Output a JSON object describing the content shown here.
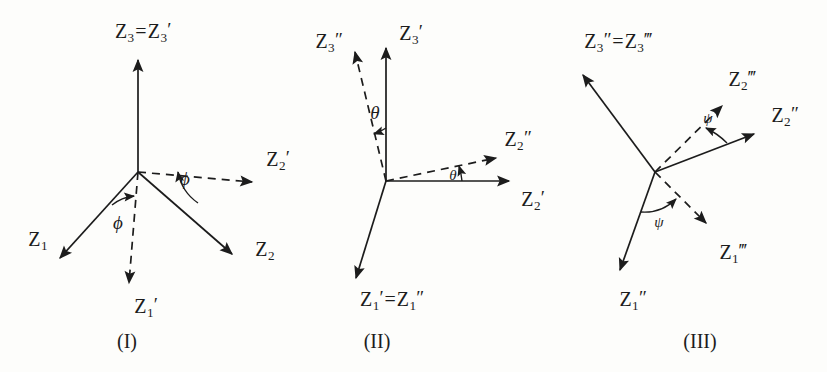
{
  "figure": {
    "width": 827,
    "height": 372,
    "background": "#fdfdfb",
    "ink": "#1c1c1c"
  },
  "panels": [
    {
      "id": "panel-1",
      "caption": "(I)",
      "caption_pos": [
        127,
        341
      ],
      "origin": [
        138,
        172
      ],
      "rotation_symbol": "ϕ",
      "axes": [
        {
          "name": "z3-equals-z3prime",
          "label": "Z₃=Z₃′",
          "label_html": "Z<sub>3</sub><span class=\"eq\">=</span>Z<sub>3</sub><span class=\"pr\">′</span>",
          "label_pos": [
            143,
            32
          ],
          "style": "solid",
          "tip": [
            138,
            55
          ]
        },
        {
          "name": "z1",
          "label": "Z₁",
          "label_html": "Z<sub>1</sub>",
          "label_pos": [
            38,
            240
          ],
          "style": "solid",
          "tip": [
            55,
            263
          ]
        },
        {
          "name": "z2",
          "label": "Z₂",
          "label_html": "Z<sub>2</sub>",
          "label_pos": [
            265,
            250
          ],
          "style": "solid",
          "tip": [
            237,
            258
          ]
        },
        {
          "name": "z1-prime",
          "label": "Z₁′",
          "label_html": "Z<sub>1</sub><span class=\"pr\">′</span>",
          "label_pos": [
            146,
            307
          ],
          "style": "dashed",
          "tip": [
            128,
            289
          ]
        },
        {
          "name": "z2-prime",
          "label": "Z₂′",
          "label_html": "Z<sub>2</sub><span class=\"pr\">′</span>",
          "label_pos": [
            278,
            160
          ],
          "style": "dashed",
          "tip": [
            258,
            183
          ]
        }
      ],
      "angle_marks": [
        {
          "name": "phi-left",
          "symbol": "ϕ",
          "pos": [
            118,
            222
          ]
        },
        {
          "name": "phi-right",
          "symbol": "ϕ",
          "pos": [
            185,
            178
          ]
        }
      ]
    },
    {
      "id": "panel-2",
      "caption": "(II)",
      "caption_pos": [
        377,
        341
      ],
      "origin": [
        386,
        181
      ],
      "rotation_symbol": "θ",
      "axes": [
        {
          "name": "z3-prime",
          "label": "Z₃′",
          "label_html": "Z<sub>3</sub><span class=\"pr\">′</span>",
          "label_pos": [
            411,
            34
          ],
          "style": "solid",
          "tip": [
            386,
            43
          ]
        },
        {
          "name": "z2-prime",
          "label": "Z₂′",
          "label_html": "Z<sub>2</sub><span class=\"pr\">′</span>",
          "label_pos": [
            533,
            200
          ],
          "style": "solid",
          "tip": [
            515,
            182
          ]
        },
        {
          "name": "z1-prime-equals-z1-dprime",
          "label": "Z₁′=Z₁″",
          "label_html": "Z<sub>1</sub><span class=\"pr\">′</span><span class=\"eq\">=</span>Z<sub>1</sub><span class=\"pr\">″</span>",
          "label_pos": [
            392,
            300
          ],
          "style": "solid",
          "tip": [
            351,
            283
          ]
        },
        {
          "name": "z3-dprime",
          "label": "Z₃″",
          "label_html": "Z<sub>3</sub><span class=\"pr\">″</span>",
          "label_pos": [
            329,
            42
          ],
          "style": "dashed",
          "tip": [
            352,
            47
          ]
        },
        {
          "name": "z2-dprime",
          "label": "Z₂″",
          "label_html": "Z<sub>2</sub><span class=\"pr\">″</span>",
          "label_pos": [
            518,
            140
          ],
          "style": "dashed",
          "tip": [
            501,
            155
          ]
        }
      ],
      "angle_marks": [
        {
          "name": "theta-upper",
          "symbol": "θ",
          "pos": [
            375,
            112
          ]
        },
        {
          "name": "theta-lower",
          "symbol": "θ",
          "pos": [
            453,
            175
          ]
        }
      ]
    },
    {
      "id": "panel-3",
      "caption": "(III)",
      "caption_pos": [
        700,
        341
      ],
      "origin": [
        655,
        172
      ],
      "rotation_symbol": "ψ",
      "axes": [
        {
          "name": "z3-dprime-equals-z3-tprime",
          "label": "Z₃″=Z₃‴",
          "label_html": "Z<sub>3</sub><span class=\"pr\">″</span><span class=\"eq\">=</span>Z<sub>3</sub><span class=\"pr\">‴</span>",
          "label_pos": [
            618,
            42
          ],
          "style": "solid",
          "tip": [
            578,
            70
          ]
        },
        {
          "name": "z2-dprime",
          "label": "Z₂″",
          "label_html": "Z<sub>2</sub><span class=\"pr\">″</span>",
          "label_pos": [
            785,
            116
          ],
          "style": "solid",
          "tip": [
            760,
            130
          ]
        },
        {
          "name": "z1-dprime",
          "label": "Z₁″",
          "label_html": "Z<sub>1</sub><span class=\"pr\">″</span>",
          "label_pos": [
            633,
            300
          ],
          "style": "solid",
          "tip": [
            617,
            276
          ]
        },
        {
          "name": "z2-tprime",
          "label": "Z₂‴",
          "label_html": "Z<sub>2</sub><span class=\"pr\">‴</span>",
          "label_pos": [
            742,
            80
          ],
          "style": "dashed",
          "tip": [
            728,
            100
          ]
        },
        {
          "name": "z1-tprime",
          "label": "Z₁‴",
          "label_html": "Z<sub>1</sub><span class=\"pr\">‴</span>",
          "label_pos": [
            733,
            253
          ],
          "style": "dashed",
          "tip": [
            712,
            228
          ]
        }
      ],
      "angle_marks": [
        {
          "name": "psi-upper",
          "symbol": "ψ",
          "pos": [
            708,
            118
          ]
        },
        {
          "name": "psi-lower",
          "symbol": "ψ",
          "pos": [
            659,
            222
          ]
        }
      ]
    }
  ]
}
